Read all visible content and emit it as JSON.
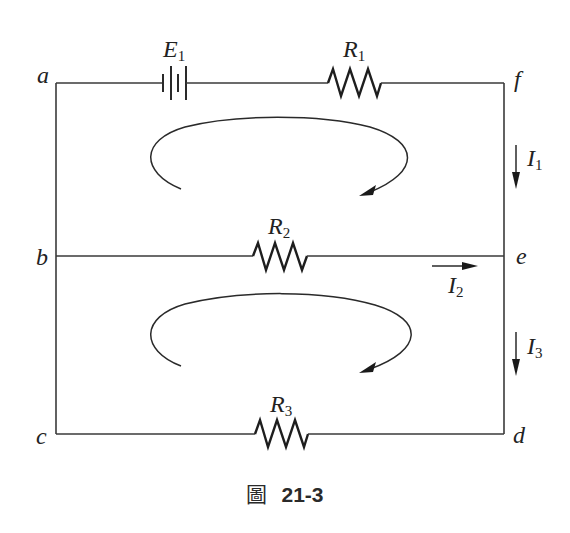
{
  "diagram": {
    "type": "circuit",
    "nodes": {
      "a": "a",
      "b": "b",
      "c": "c",
      "d": "d",
      "e": "e",
      "f": "f"
    },
    "components": {
      "battery": {
        "symbol": "E",
        "sub": "1",
        "branch": "a-f (top)"
      },
      "r1": {
        "symbol": "R",
        "sub": "1",
        "branch": "a-f (top)"
      },
      "r2": {
        "symbol": "R",
        "sub": "2",
        "branch": "b-e (middle)"
      },
      "r3": {
        "symbol": "R",
        "sub": "3",
        "branch": "c-d (bottom)"
      }
    },
    "currents": {
      "i1": {
        "symbol": "I",
        "sub": "1",
        "direction": "down",
        "location": "f-e"
      },
      "i2": {
        "symbol": "I",
        "sub": "2",
        "direction": "right",
        "location": "b-e"
      },
      "i3": {
        "symbol": "I",
        "sub": "3",
        "direction": "down",
        "location": "e-d"
      }
    },
    "loops": [
      {
        "name": "upper-loop",
        "direction": "clockwise"
      },
      {
        "name": "lower-loop",
        "direction": "clockwise"
      }
    ],
    "colors": {
      "line": "#2a2a2a",
      "background": "#ffffff"
    }
  },
  "caption": {
    "prefix": "圖",
    "number": "21-3"
  }
}
